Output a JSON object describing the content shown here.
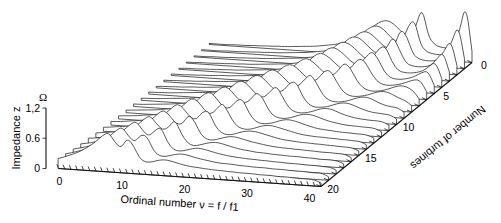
{
  "figure": {
    "background": "#ffffff",
    "line_color": "#222222",
    "axis_color": "#111111"
  },
  "axes": {
    "z": {
      "label": "Impedance z",
      "unit": "Ω",
      "ticks": [
        "0",
        "0.6",
        "1,2"
      ],
      "tick_values": [
        0,
        0.6,
        1.2
      ],
      "min": 0,
      "max": 1.2
    },
    "x": {
      "label": "Ordinal number ν = f / f1",
      "ticks": [
        "0",
        "10",
        "20",
        "30",
        "40"
      ],
      "tick_values": [
        0,
        10,
        20,
        30,
        40
      ],
      "min": 0,
      "max": 42
    },
    "depth": {
      "label": "Number of turbines",
      "ticks": [
        "0",
        "5",
        "10",
        "15",
        "20"
      ],
      "tick_values": [
        0,
        5,
        10,
        15,
        20
      ],
      "min": 0,
      "max": 20
    }
  },
  "chart_data": {
    "type": "line",
    "title": "",
    "subtitle": "",
    "xlabel": "Ordinal number ν = f / f1",
    "ylabel": "Impedance z",
    "zlabel": "Number of turbines",
    "yunit": "Ω",
    "xlim": [
      0,
      42
    ],
    "ylim": [
      0,
      1.2
    ],
    "zlim": [
      0,
      20
    ],
    "grid": false,
    "legend": "none",
    "projection": "waterfall-3d",
    "x": [
      0,
      1,
      2,
      3,
      4,
      5,
      6,
      7,
      8,
      9,
      10,
      11,
      12,
      13,
      14,
      15,
      16,
      17,
      18,
      19,
      20,
      21,
      22,
      23,
      24,
      25,
      26,
      27,
      28,
      29,
      30,
      31,
      32,
      33,
      34,
      35,
      36,
      37,
      38,
      39,
      40,
      41,
      42
    ],
    "series": [
      {
        "name": "0",
        "turbines": 0,
        "values": [
          0.02,
          0.02,
          0.02,
          0.02,
          0.03,
          0.03,
          0.03,
          0.04,
          0.04,
          0.05,
          0.05,
          0.06,
          0.06,
          0.07,
          0.08,
          0.09,
          0.1,
          0.11,
          0.13,
          0.15,
          0.17,
          0.2,
          0.24,
          0.29,
          0.36,
          0.45,
          0.56,
          0.66,
          0.72,
          0.7,
          0.6,
          0.48,
          0.4,
          0.62,
          1.05,
          0.46,
          0.3,
          0.26,
          0.25,
          0.26,
          0.6,
          1.18,
          0.22
        ]
      },
      {
        "name": "1",
        "turbines": 1,
        "values": [
          0.02,
          0.02,
          0.02,
          0.02,
          0.03,
          0.03,
          0.03,
          0.04,
          0.04,
          0.05,
          0.05,
          0.06,
          0.06,
          0.07,
          0.08,
          0.09,
          0.1,
          0.11,
          0.13,
          0.15,
          0.17,
          0.2,
          0.24,
          0.3,
          0.38,
          0.48,
          0.6,
          0.7,
          0.74,
          0.68,
          0.55,
          0.44,
          0.42,
          0.78,
          0.92,
          0.4,
          0.28,
          0.25,
          0.24,
          0.26,
          0.52,
          0.88,
          0.2
        ]
      },
      {
        "name": "2",
        "turbines": 2,
        "values": [
          0.02,
          0.02,
          0.02,
          0.03,
          0.03,
          0.03,
          0.04,
          0.04,
          0.05,
          0.05,
          0.06,
          0.06,
          0.07,
          0.08,
          0.09,
          0.1,
          0.11,
          0.12,
          0.14,
          0.16,
          0.19,
          0.22,
          0.27,
          0.33,
          0.42,
          0.54,
          0.66,
          0.74,
          0.72,
          0.62,
          0.5,
          0.42,
          0.48,
          0.84,
          0.7,
          0.34,
          0.26,
          0.24,
          0.24,
          0.27,
          0.46,
          0.7,
          0.19
        ]
      },
      {
        "name": "3",
        "turbines": 3,
        "values": [
          0.02,
          0.02,
          0.03,
          0.03,
          0.03,
          0.04,
          0.04,
          0.05,
          0.05,
          0.06,
          0.06,
          0.07,
          0.08,
          0.09,
          0.1,
          0.11,
          0.12,
          0.14,
          0.16,
          0.18,
          0.21,
          0.25,
          0.31,
          0.38,
          0.48,
          0.6,
          0.72,
          0.76,
          0.7,
          0.58,
          0.47,
          0.44,
          0.58,
          0.82,
          0.56,
          0.3,
          0.25,
          0.24,
          0.25,
          0.28,
          0.42,
          0.58,
          0.18
        ]
      },
      {
        "name": "4",
        "turbines": 4,
        "values": [
          0.02,
          0.03,
          0.03,
          0.03,
          0.04,
          0.04,
          0.05,
          0.05,
          0.06,
          0.06,
          0.07,
          0.08,
          0.09,
          0.1,
          0.11,
          0.12,
          0.14,
          0.16,
          0.18,
          0.21,
          0.24,
          0.29,
          0.35,
          0.44,
          0.55,
          0.68,
          0.77,
          0.75,
          0.66,
          0.54,
          0.45,
          0.5,
          0.7,
          0.74,
          0.44,
          0.27,
          0.24,
          0.24,
          0.26,
          0.3,
          0.4,
          0.5,
          0.17
        ]
      },
      {
        "name": "5",
        "turbines": 5,
        "values": [
          0.03,
          0.03,
          0.03,
          0.04,
          0.04,
          0.05,
          0.05,
          0.06,
          0.07,
          0.07,
          0.08,
          0.09,
          0.1,
          0.11,
          0.13,
          0.14,
          0.16,
          0.18,
          0.21,
          0.24,
          0.28,
          0.33,
          0.41,
          0.51,
          0.63,
          0.75,
          0.78,
          0.71,
          0.6,
          0.49,
          0.47,
          0.62,
          0.76,
          0.62,
          0.36,
          0.25,
          0.23,
          0.24,
          0.27,
          0.32,
          0.4,
          0.44,
          0.16
        ]
      },
      {
        "name": "6",
        "turbines": 6,
        "values": [
          0.03,
          0.03,
          0.04,
          0.04,
          0.05,
          0.05,
          0.06,
          0.07,
          0.07,
          0.08,
          0.09,
          0.1,
          0.11,
          0.13,
          0.14,
          0.16,
          0.18,
          0.21,
          0.24,
          0.28,
          0.32,
          0.39,
          0.48,
          0.59,
          0.72,
          0.79,
          0.74,
          0.64,
          0.53,
          0.46,
          0.54,
          0.72,
          0.7,
          0.48,
          0.3,
          0.24,
          0.23,
          0.25,
          0.28,
          0.33,
          0.38,
          0.38,
          0.15
        ]
      },
      {
        "name": "7",
        "turbines": 7,
        "values": [
          0.03,
          0.04,
          0.04,
          0.05,
          0.05,
          0.06,
          0.07,
          0.07,
          0.08,
          0.09,
          0.1,
          0.12,
          0.13,
          0.15,
          0.17,
          0.19,
          0.22,
          0.25,
          0.29,
          0.34,
          0.41,
          0.5,
          0.62,
          0.74,
          0.8,
          0.73,
          0.62,
          0.51,
          0.47,
          0.58,
          0.76,
          0.66,
          0.42,
          0.28,
          0.23,
          0.23,
          0.25,
          0.29,
          0.34,
          0.38,
          0.36,
          0.3,
          0.14
        ]
      },
      {
        "name": "8",
        "turbines": 8,
        "values": [
          0.04,
          0.04,
          0.05,
          0.05,
          0.06,
          0.07,
          0.08,
          0.09,
          0.1,
          0.11,
          0.12,
          0.14,
          0.16,
          0.18,
          0.2,
          0.23,
          0.27,
          0.31,
          0.37,
          0.45,
          0.55,
          0.67,
          0.77,
          0.78,
          0.68,
          0.56,
          0.47,
          0.52,
          0.7,
          0.72,
          0.5,
          0.31,
          0.24,
          0.23,
          0.25,
          0.28,
          0.33,
          0.37,
          0.37,
          0.32,
          0.26,
          0.22,
          0.13
        ]
      },
      {
        "name": "9",
        "turbines": 9,
        "values": [
          0.04,
          0.05,
          0.05,
          0.06,
          0.07,
          0.08,
          0.09,
          0.1,
          0.11,
          0.13,
          0.15,
          0.17,
          0.19,
          0.22,
          0.25,
          0.29,
          0.34,
          0.41,
          0.5,
          0.61,
          0.73,
          0.8,
          0.73,
          0.61,
          0.5,
          0.48,
          0.62,
          0.76,
          0.58,
          0.35,
          0.25,
          0.23,
          0.24,
          0.27,
          0.32,
          0.36,
          0.37,
          0.33,
          0.27,
          0.23,
          0.21,
          0.2,
          0.12
        ]
      },
      {
        "name": "10",
        "turbines": 10,
        "values": [
          0.05,
          0.05,
          0.06,
          0.07,
          0.08,
          0.09,
          0.1,
          0.12,
          0.13,
          0.15,
          0.17,
          0.2,
          0.23,
          0.26,
          0.3,
          0.36,
          0.43,
          0.52,
          0.64,
          0.76,
          0.8,
          0.7,
          0.57,
          0.48,
          0.52,
          0.7,
          0.7,
          0.42,
          0.27,
          0.23,
          0.24,
          0.26,
          0.31,
          0.35,
          0.36,
          0.33,
          0.28,
          0.24,
          0.21,
          0.2,
          0.19,
          0.18,
          0.11
        ]
      },
      {
        "name": "11",
        "turbines": 11,
        "values": [
          0.05,
          0.06,
          0.07,
          0.08,
          0.09,
          0.1,
          0.12,
          0.14,
          0.16,
          0.18,
          0.21,
          0.24,
          0.28,
          0.32,
          0.38,
          0.46,
          0.56,
          0.68,
          0.79,
          0.77,
          0.64,
          0.51,
          0.48,
          0.62,
          0.74,
          0.52,
          0.31,
          0.24,
          0.23,
          0.25,
          0.29,
          0.34,
          0.36,
          0.34,
          0.29,
          0.25,
          0.22,
          0.2,
          0.19,
          0.18,
          0.18,
          0.17,
          0.11
        ]
      },
      {
        "name": "12",
        "turbines": 12,
        "values": [
          0.06,
          0.07,
          0.08,
          0.09,
          0.11,
          0.12,
          0.14,
          0.16,
          0.19,
          0.22,
          0.25,
          0.29,
          0.34,
          0.41,
          0.49,
          0.6,
          0.72,
          0.8,
          0.71,
          0.56,
          0.47,
          0.55,
          0.72,
          0.62,
          0.36,
          0.25,
          0.23,
          0.24,
          0.28,
          0.33,
          0.35,
          0.34,
          0.3,
          0.26,
          0.23,
          0.21,
          0.19,
          0.18,
          0.18,
          0.17,
          0.17,
          0.16,
          0.1
        ]
      },
      {
        "name": "13",
        "turbines": 13,
        "values": [
          0.07,
          0.08,
          0.09,
          0.11,
          0.12,
          0.14,
          0.17,
          0.19,
          0.22,
          0.26,
          0.3,
          0.36,
          0.43,
          0.52,
          0.64,
          0.76,
          0.79,
          0.64,
          0.5,
          0.49,
          0.66,
          0.7,
          0.43,
          0.27,
          0.23,
          0.24,
          0.27,
          0.32,
          0.35,
          0.34,
          0.31,
          0.27,
          0.24,
          0.21,
          0.2,
          0.19,
          0.18,
          0.17,
          0.17,
          0.16,
          0.16,
          0.15,
          0.1
        ]
      },
      {
        "name": "14",
        "turbines": 14,
        "values": [
          0.08,
          0.09,
          0.11,
          0.12,
          0.14,
          0.17,
          0.19,
          0.23,
          0.26,
          0.31,
          0.37,
          0.44,
          0.54,
          0.66,
          0.78,
          0.74,
          0.57,
          0.47,
          0.58,
          0.74,
          0.52,
          0.31,
          0.24,
          0.23,
          0.26,
          0.31,
          0.34,
          0.34,
          0.31,
          0.28,
          0.25,
          0.22,
          0.2,
          0.19,
          0.18,
          0.18,
          0.17,
          0.17,
          0.16,
          0.16,
          0.15,
          0.15,
          0.09
        ]
      },
      {
        "name": "15",
        "turbines": 15,
        "values": [
          0.09,
          0.11,
          0.12,
          0.14,
          0.17,
          0.2,
          0.23,
          0.27,
          0.32,
          0.38,
          0.46,
          0.56,
          0.68,
          0.79,
          0.69,
          0.53,
          0.48,
          0.66,
          0.68,
          0.39,
          0.26,
          0.23,
          0.25,
          0.3,
          0.33,
          0.34,
          0.32,
          0.29,
          0.26,
          0.23,
          0.21,
          0.2,
          0.19,
          0.18,
          0.18,
          0.17,
          0.17,
          0.16,
          0.16,
          0.15,
          0.15,
          0.14,
          0.09
        ]
      },
      {
        "name": "16",
        "turbines": 16,
        "values": [
          0.11,
          0.12,
          0.14,
          0.17,
          0.2,
          0.23,
          0.27,
          0.32,
          0.38,
          0.46,
          0.56,
          0.68,
          0.78,
          0.66,
          0.51,
          0.51,
          0.72,
          0.58,
          0.32,
          0.24,
          0.24,
          0.28,
          0.32,
          0.34,
          0.32,
          0.29,
          0.26,
          0.24,
          0.22,
          0.2,
          0.19,
          0.18,
          0.18,
          0.17,
          0.17,
          0.16,
          0.16,
          0.15,
          0.15,
          0.15,
          0.14,
          0.14,
          0.08
        ]
      },
      {
        "name": "17",
        "turbines": 17,
        "values": [
          0.12,
          0.14,
          0.17,
          0.2,
          0.23,
          0.28,
          0.33,
          0.39,
          0.47,
          0.57,
          0.69,
          0.78,
          0.63,
          0.5,
          0.56,
          0.74,
          0.46,
          0.28,
          0.23,
          0.26,
          0.3,
          0.33,
          0.33,
          0.3,
          0.27,
          0.24,
          0.22,
          0.21,
          0.19,
          0.19,
          0.18,
          0.17,
          0.17,
          0.16,
          0.16,
          0.16,
          0.15,
          0.15,
          0.14,
          0.14,
          0.14,
          0.13,
          0.08
        ]
      },
      {
        "name": "18",
        "turbines": 18,
        "values": [
          0.14,
          0.17,
          0.2,
          0.24,
          0.28,
          0.33,
          0.4,
          0.48,
          0.58,
          0.7,
          0.78,
          0.61,
          0.49,
          0.62,
          0.7,
          0.4,
          0.26,
          0.24,
          0.27,
          0.31,
          0.33,
          0.31,
          0.28,
          0.25,
          0.23,
          0.21,
          0.2,
          0.19,
          0.18,
          0.18,
          0.17,
          0.17,
          0.16,
          0.16,
          0.15,
          0.15,
          0.15,
          0.14,
          0.14,
          0.14,
          0.13,
          0.13,
          0.08
        ]
      },
      {
        "name": "19",
        "turbines": 19,
        "values": [
          0.17,
          0.2,
          0.24,
          0.28,
          0.34,
          0.4,
          0.48,
          0.58,
          0.7,
          0.78,
          0.6,
          0.49,
          0.66,
          0.62,
          0.34,
          0.25,
          0.25,
          0.29,
          0.32,
          0.32,
          0.29,
          0.26,
          0.24,
          0.22,
          0.2,
          0.19,
          0.19,
          0.18,
          0.17,
          0.17,
          0.16,
          0.16,
          0.16,
          0.15,
          0.15,
          0.15,
          0.14,
          0.14,
          0.14,
          0.13,
          0.13,
          0.13,
          0.07
        ]
      },
      {
        "name": "20",
        "turbines": 20,
        "values": [
          0.2,
          0.24,
          0.29,
          0.34,
          0.41,
          0.49,
          0.59,
          0.71,
          0.79,
          0.6,
          0.48,
          0.7,
          0.56,
          0.3,
          0.24,
          0.26,
          0.3,
          0.32,
          0.3,
          0.27,
          0.24,
          0.22,
          0.21,
          0.2,
          0.19,
          0.18,
          0.18,
          0.17,
          0.17,
          0.16,
          0.16,
          0.16,
          0.15,
          0.15,
          0.15,
          0.14,
          0.14,
          0.14,
          0.13,
          0.13,
          0.13,
          0.12,
          0.07
        ]
      }
    ]
  }
}
